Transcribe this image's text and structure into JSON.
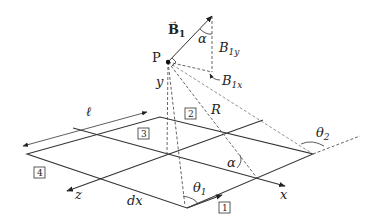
{
  "diagram": {
    "point_label": "P",
    "vector_label": "B",
    "vector_subscript": "1",
    "component_y_label": "B",
    "component_y_subscript": "1y",
    "component_x_label": "B",
    "component_x_subscript": "1x",
    "angle_alpha_top": "α",
    "angle_alpha_bottom": "α",
    "height_label": "y",
    "distance_label": "R",
    "side_length_label": "ℓ",
    "element_label": "dx",
    "theta1_label": "θ",
    "theta1_subscript": "1",
    "theta2_label": "θ",
    "theta2_subscript": "2",
    "axis_x_label": "x",
    "axis_z_label": "z",
    "segments": [
      {
        "id": "1",
        "label": "1"
      },
      {
        "id": "2",
        "label": "2"
      },
      {
        "id": "3",
        "label": "3"
      },
      {
        "id": "4",
        "label": "4"
      }
    ]
  }
}
